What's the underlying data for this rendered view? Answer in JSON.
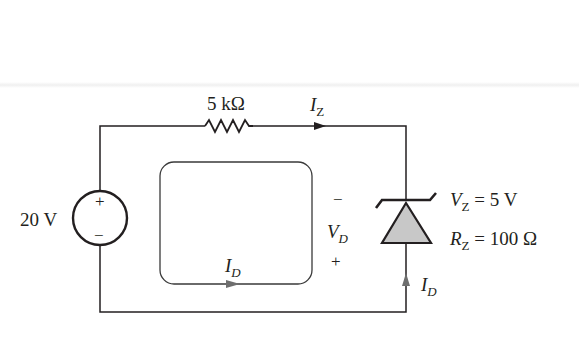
{
  "diagram": {
    "type": "circuit-schematic",
    "components": {
      "source": {
        "label": "20 V",
        "plus": "+",
        "minus": "−"
      },
      "resistor": {
        "label": "5 kΩ"
      },
      "zener": {
        "vz_symbol": "V",
        "vz_sub": "Z",
        "vz_value": "= 5 V",
        "rz_symbol": "R",
        "rz_sub": "Z",
        "rz_value": "= 100 Ω"
      }
    },
    "currents": {
      "iz": {
        "symbol": "I",
        "sub": "Z"
      },
      "id_loop": {
        "symbol": "I",
        "sub": "D"
      },
      "id_branch": {
        "symbol": "I",
        "sub": "D"
      }
    },
    "voltage_vd": {
      "minus": "−",
      "symbol": "V",
      "sub": "D",
      "plus": "+"
    },
    "colors": {
      "wire": "#231f20",
      "diode_fill": "#c8c8c8",
      "loop": "#3a3a3a"
    }
  }
}
